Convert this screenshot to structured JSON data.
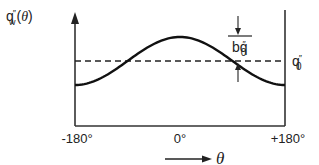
{
  "diagram": {
    "y_label_main": "q",
    "y_label_primes": "″",
    "y_label_sub": "w",
    "y_label_arg_open": "(",
    "y_label_arg": "θ",
    "y_label_arg_close": ")",
    "ref_label_main": "q",
    "ref_label_primes": "″",
    "ref_label_sub": "0",
    "amp_label_b": "b",
    "amp_label_main": "q",
    "amp_label_primes": "″",
    "amp_label_sub": "0",
    "x_axis_symbol": "θ"
  },
  "chart_data": {
    "type": "line",
    "title": "",
    "xlabel": "θ",
    "ylabel": "q″w(θ)",
    "x_ticks": [
      {
        "value": -180,
        "label": "-180°"
      },
      {
        "value": 0,
        "label": "0°"
      },
      {
        "value": 180,
        "label": "+180°"
      }
    ],
    "xlim": [
      -180,
      180
    ],
    "ylim": [
      0,
      2.2
    ],
    "reference_line": {
      "label": "q″₀",
      "value": 1.0,
      "style": "dashed"
    },
    "amplitude_annotation": {
      "label": "bq″₀",
      "value": 0.45
    },
    "series": [
      {
        "name": "q″w(θ)",
        "function": "q0 * (1 + b * cos(theta))",
        "q0": 1.0,
        "b": 0.45
      }
    ],
    "grid": false,
    "legend": "none"
  }
}
